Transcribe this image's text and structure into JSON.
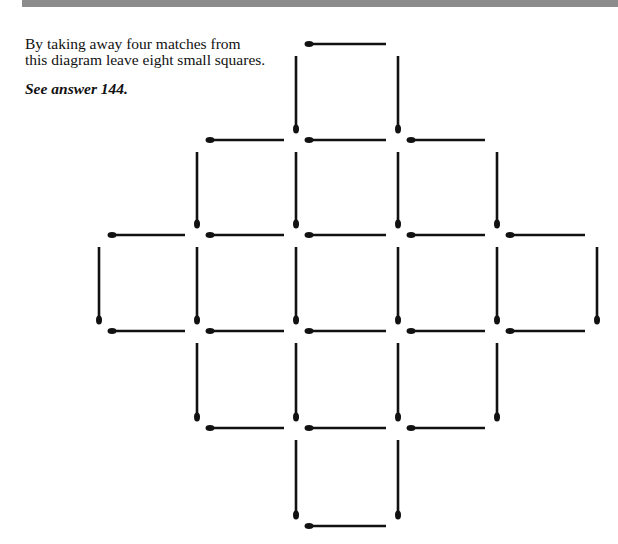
{
  "puzzle": {
    "line1": "By taking away four matches from",
    "line2": "this diagram leave eight small squares.",
    "answer_ref": "See answer 144."
  },
  "diagram": {
    "type": "matchstick-puzzle",
    "match_color": "#111111",
    "grid_x": [
      99,
      197,
      296,
      398,
      497,
      597
    ],
    "grid_y": [
      44,
      140,
      235,
      331,
      428,
      526
    ],
    "horizontal_matches": [
      {
        "row": 0,
        "from_col": 2
      },
      {
        "row": 1,
        "from_col": 1
      },
      {
        "row": 1,
        "from_col": 2
      },
      {
        "row": 1,
        "from_col": 3
      },
      {
        "row": 2,
        "from_col": 0
      },
      {
        "row": 2,
        "from_col": 1
      },
      {
        "row": 2,
        "from_col": 2
      },
      {
        "row": 2,
        "from_col": 3
      },
      {
        "row": 2,
        "from_col": 4
      },
      {
        "row": 3,
        "from_col": 0
      },
      {
        "row": 3,
        "from_col": 1
      },
      {
        "row": 3,
        "from_col": 2
      },
      {
        "row": 3,
        "from_col": 3
      },
      {
        "row": 3,
        "from_col": 4
      },
      {
        "row": 4,
        "from_col": 1
      },
      {
        "row": 4,
        "from_col": 2
      },
      {
        "row": 4,
        "from_col": 3
      },
      {
        "row": 5,
        "from_col": 2
      }
    ],
    "vertical_matches": [
      {
        "col": 2,
        "from_row": 0
      },
      {
        "col": 3,
        "from_row": 0
      },
      {
        "col": 1,
        "from_row": 1
      },
      {
        "col": 2,
        "from_row": 1
      },
      {
        "col": 3,
        "from_row": 1
      },
      {
        "col": 4,
        "from_row": 1
      },
      {
        "col": 0,
        "from_row": 2
      },
      {
        "col": 1,
        "from_row": 2
      },
      {
        "col": 2,
        "from_row": 2
      },
      {
        "col": 3,
        "from_row": 2
      },
      {
        "col": 4,
        "from_row": 2
      },
      {
        "col": 5,
        "from_row": 2
      },
      {
        "col": 1,
        "from_row": 3
      },
      {
        "col": 2,
        "from_row": 3
      },
      {
        "col": 3,
        "from_row": 3
      },
      {
        "col": 4,
        "from_row": 3
      },
      {
        "col": 2,
        "from_row": 4
      },
      {
        "col": 3,
        "from_row": 4
      }
    ],
    "total_matches": 36
  }
}
